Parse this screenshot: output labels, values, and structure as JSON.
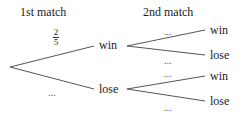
{
  "headers": {
    "first": "1st match",
    "second": "2nd match"
  },
  "first_match": {
    "win": {
      "label": "win",
      "probability": {
        "numerator": "2",
        "denominator": "5"
      }
    },
    "lose": {
      "label": "lose",
      "probability": "..."
    }
  },
  "second_match": {
    "after_win": {
      "win": {
        "label": "win",
        "probability": "..."
      },
      "lose": {
        "label": "lose",
        "probability": "..."
      }
    },
    "after_lose": {
      "win": {
        "label": "win",
        "probability": "..."
      },
      "lose": {
        "label": "lose",
        "probability": "..."
      }
    }
  },
  "colors": {
    "line": "#555555",
    "text": "#222222"
  }
}
